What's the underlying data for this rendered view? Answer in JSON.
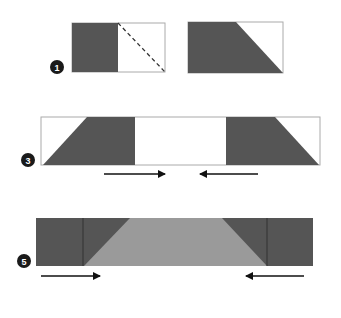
{
  "colors": {
    "dark": "#555555",
    "light": "#9a9a9a",
    "border": "#aaaaaa",
    "white": "#ffffff",
    "badge": "#1a1a1a",
    "arrow": "#111111"
  },
  "steps": [
    {
      "number": "1",
      "label": "step-1"
    },
    {
      "number": "3",
      "label": "step-3"
    },
    {
      "number": "5",
      "label": "step-5"
    }
  ]
}
